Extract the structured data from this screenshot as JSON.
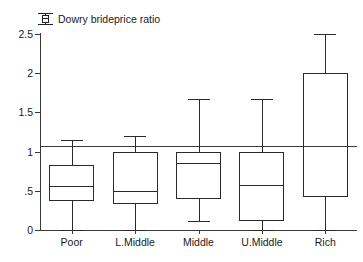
{
  "legend": {
    "icon": "boxplot-icon",
    "label": "Dowry brideprice ratio"
  },
  "chart_data": {
    "type": "box",
    "title": "Dowry brideprice ratio",
    "xlabel": "",
    "ylabel": "",
    "ylim": [
      0,
      2.5
    ],
    "yticks": [
      "0",
      ".5",
      "1",
      "1.5",
      "2",
      "2.5"
    ],
    "ytick_values": [
      0,
      0.5,
      1,
      1.5,
      2,
      2.5
    ],
    "grid": false,
    "reference_line": 1,
    "legend_position": "top-left",
    "categories": [
      "Poor",
      "L.Middle",
      "Middle",
      "U.Middle",
      "Rich"
    ],
    "boxes": [
      {
        "category": "Poor",
        "whisker_low": 0.0,
        "q1": 0.37,
        "median": 0.56,
        "q3": 0.83,
        "whisker_high": 1.15
      },
      {
        "category": "L.Middle",
        "whisker_low": 0.0,
        "q1": 0.33,
        "median": 0.5,
        "q3": 1.0,
        "whisker_high": 1.2
      },
      {
        "category": "Middle",
        "whisker_low": 0.12,
        "q1": 0.39,
        "median": 0.85,
        "q3": 1.0,
        "whisker_high": 1.67
      },
      {
        "category": "U.Middle",
        "whisker_low": 0.0,
        "q1": 0.12,
        "median": 0.57,
        "q3": 1.0,
        "whisker_high": 1.67
      },
      {
        "category": "Rich",
        "whisker_low": 0.0,
        "q1": 0.42,
        "median": 2.0,
        "q3": 2.0,
        "whisker_high": 2.5
      }
    ]
  },
  "colors": {
    "line": "#2a2a2a",
    "axis": "#3a3a3a",
    "background": "#ffffff",
    "text": "#1a1a1a"
  }
}
